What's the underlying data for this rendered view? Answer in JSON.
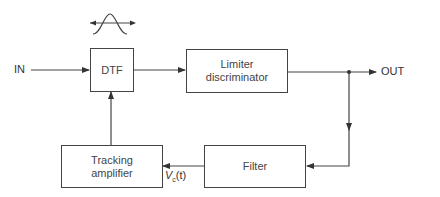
{
  "diagram": {
    "type": "block-diagram",
    "blocks": {
      "dtf": {
        "label": "DTF"
      },
      "limiter": {
        "line1": "Limiter",
        "line2": "discriminator"
      },
      "tracking": {
        "line1": "Tracking",
        "line2": "amplifier"
      },
      "filter": {
        "label": "Filter"
      }
    },
    "terminals": {
      "input": "IN",
      "output": "OUT"
    },
    "signals": {
      "control_symbol": "V",
      "control_subscript": "c",
      "control_arg": "(t)"
    },
    "icons": {
      "bandpass_response": "gaussian-bell-with-bidirectional-arrows"
    },
    "connections": [
      {
        "from": "IN",
        "to": "DTF"
      },
      {
        "from": "DTF",
        "to": "Limiter discriminator"
      },
      {
        "from": "Limiter discriminator",
        "to": "OUT"
      },
      {
        "from": "Limiter discriminator",
        "to": "Filter"
      },
      {
        "from": "Filter",
        "to": "Tracking amplifier",
        "label": "Vc(t)"
      },
      {
        "from": "Tracking amplifier",
        "to": "DTF"
      }
    ],
    "colors": {
      "line": "#444444",
      "background": "#ffffff"
    }
  }
}
